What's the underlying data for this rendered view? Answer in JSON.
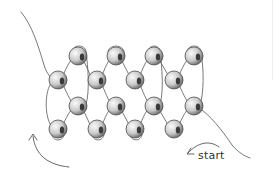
{
  "diagram": {
    "labels": {
      "start": "start"
    },
    "colors": {
      "thread": "#6a6a6a",
      "bead_light": "#f4f4f4",
      "bead_mid": "#bdbdbd",
      "bead_dark": "#3a3a3a",
      "background": "#ffffff"
    },
    "bead_rx": 9,
    "bead_ry": 9,
    "beads": [
      {
        "row": 1,
        "x": 78,
        "y": 56
      },
      {
        "row": 1,
        "x": 116,
        "y": 56
      },
      {
        "row": 1,
        "x": 154,
        "y": 56
      },
      {
        "row": 1,
        "x": 194,
        "y": 56
      },
      {
        "row": 2,
        "x": 58,
        "y": 80
      },
      {
        "row": 2,
        "x": 97,
        "y": 80
      },
      {
        "row": 2,
        "x": 135,
        "y": 80
      },
      {
        "row": 2,
        "x": 174,
        "y": 80
      },
      {
        "row": 3,
        "x": 78,
        "y": 106
      },
      {
        "row": 3,
        "x": 116,
        "y": 106
      },
      {
        "row": 3,
        "x": 154,
        "y": 106
      },
      {
        "row": 3,
        "x": 194,
        "y": 106
      },
      {
        "row": 4,
        "x": 58,
        "y": 129
      },
      {
        "row": 4,
        "x": 97,
        "y": 129
      },
      {
        "row": 4,
        "x": 135,
        "y": 129
      },
      {
        "row": 4,
        "x": 174,
        "y": 129
      }
    ],
    "arrows": [
      {
        "name": "start-direction-arrow",
        "label_ref": "start"
      },
      {
        "name": "return-direction-arrow"
      }
    ]
  }
}
